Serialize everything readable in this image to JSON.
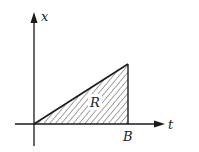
{
  "diagram": {
    "axes": {
      "vertical_label": "x",
      "horizontal_label": "t"
    },
    "region": {
      "label": "R",
      "shape": "right triangle with vertices at origin, (B,0), (B,height)",
      "fill": "diagonal hatching"
    },
    "tick_labels": {
      "b_label": "B"
    },
    "colors": {
      "ink": "#1a1a1a",
      "background": "#ffffff"
    }
  }
}
